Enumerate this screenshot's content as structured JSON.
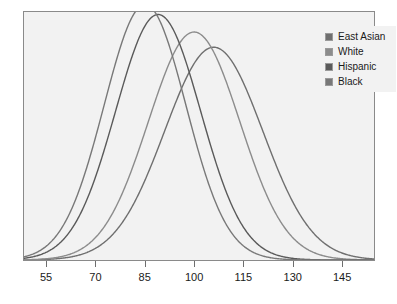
{
  "chart_data": {
    "type": "line",
    "title": "",
    "xlabel": "",
    "ylabel": "",
    "xlim": [
      48,
      155
    ],
    "ylim": [
      0,
      0.031
    ],
    "grid": false,
    "legend_position": "top-right",
    "x_ticks": [
      55,
      70,
      85,
      100,
      115,
      130,
      145
    ],
    "x_tick_labels": [
      "55",
      "70",
      "85",
      "100",
      "115",
      "130",
      "145"
    ],
    "series": [
      {
        "name": "East Asian",
        "color": "#6f6f6f",
        "distribution": "normal",
        "mean": 106,
        "sd": 15,
        "peak_density": 0.0266
      },
      {
        "name": "White",
        "color": "#8c8c8c",
        "distribution": "normal",
        "mean": 100,
        "sd": 14,
        "peak_density": 0.0285
      },
      {
        "name": "Hispanic",
        "color": "#5a5a5a",
        "distribution": "normal",
        "mean": 89,
        "sd": 13,
        "peak_density": 0.0307
      },
      {
        "name": "Black",
        "color": "#787878",
        "distribution": "normal",
        "mean": 85,
        "sd": 12.5,
        "peak_density": 0.0319
      }
    ]
  },
  "legend": {
    "items": [
      {
        "label": "East Asian",
        "color": "#6f6f6f"
      },
      {
        "label": "White",
        "color": "#8c8c8c"
      },
      {
        "label": "Hispanic",
        "color": "#5a5a5a"
      },
      {
        "label": "Black",
        "color": "#787878"
      }
    ]
  },
  "axis": {
    "ticks": [
      {
        "label": "55",
        "value": 55
      },
      {
        "label": "70",
        "value": 70
      },
      {
        "label": "85",
        "value": 85
      },
      {
        "label": "100",
        "value": 100
      },
      {
        "label": "115",
        "value": 115
      },
      {
        "label": "130",
        "value": 130
      },
      {
        "label": "145",
        "value": 145
      }
    ]
  },
  "colors": {
    "panel_background": "#f2f2f2",
    "panel_border": "#8a8a8a",
    "page_background": "#ffffff",
    "text": "#1a1a1a",
    "tick": "#6e6e6e"
  }
}
